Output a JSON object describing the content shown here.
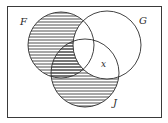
{
  "diagram": {
    "type": "venn",
    "frame": {
      "x": 7,
      "y": 6,
      "width": 154,
      "height": 111,
      "stroke": "#3a3a3a"
    },
    "sets": [
      {
        "id": "F",
        "label": "F",
        "cx": 61,
        "cy": 45,
        "r": 33,
        "label_x": 20,
        "label_y": 25
      },
      {
        "id": "G",
        "label": "G",
        "cx": 107,
        "cy": 45,
        "r": 34,
        "label_x": 139,
        "label_y": 24
      },
      {
        "id": "J",
        "label": "J",
        "cx": 85,
        "cy": 73,
        "r": 34,
        "label_x": 113,
        "label_y": 106
      }
    ],
    "region_label": {
      "text": "x",
      "x": 101,
      "y": 67,
      "region": "G ∩ J, not F"
    },
    "shaded_region": "(F ∪ J) − G",
    "hatch": {
      "style": "horizontal",
      "spacing": 3,
      "color": "#3a3a3a"
    },
    "line_color": "#2e2e2e"
  }
}
